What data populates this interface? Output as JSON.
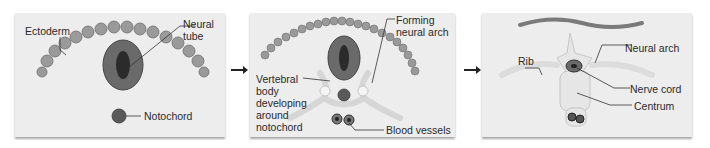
{
  "diagram": {
    "panels": [
      {
        "labels": {
          "ectoderm": "Ectoderm",
          "neural_tube": "Neural\ntube",
          "notochord": "Notochord"
        }
      },
      {
        "labels": {
          "forming_neural_arch": "Forming\nneural arch",
          "vertebral_body": "Vertebral\nbody\ndeveloping\naround\nnotochord",
          "blood_vessels": "Blood vessels"
        }
      },
      {
        "labels": {
          "rib": "Rib",
          "neural_arch": "Neural arch",
          "nerve_cord": "Nerve cord",
          "centrum": "Centrum"
        }
      }
    ],
    "arrows": [
      "panel-1-to-panel-2",
      "panel-2-to-panel-3"
    ]
  },
  "colors": {
    "panel_bg": "#ededed",
    "cell": "#9a9a9a",
    "tube_dark": "#2b2b2b",
    "bone": "#e4e4e4",
    "label_text": "#2a2a2a"
  }
}
